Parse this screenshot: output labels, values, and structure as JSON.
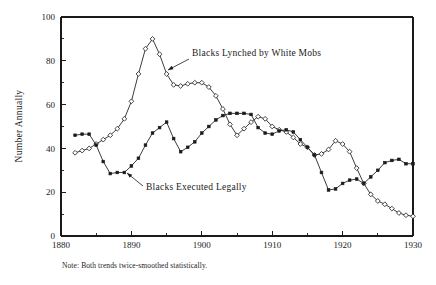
{
  "chart_data": {
    "type": "line",
    "title": "",
    "xlabel": "",
    "ylabel": "Number Annually",
    "xlim": [
      1880,
      1930
    ],
    "ylim": [
      0,
      100
    ],
    "grid": false,
    "legend_position": "inline-annotations",
    "x_ticks": [
      1880,
      1890,
      1900,
      1910,
      1920,
      1930
    ],
    "x_tick_labels": [
      "1880",
      "1890",
      "1900",
      "1910",
      "1920",
      "1930"
    ],
    "x_minor_ticks": [
      1885,
      1895,
      1905,
      1915,
      1925
    ],
    "y_ticks": [
      0,
      20,
      40,
      60,
      80,
      100
    ],
    "y_tick_labels": [
      "0",
      "20",
      "40",
      "60",
      "80",
      "100"
    ],
    "y_minor_ticks": [
      10,
      30,
      50,
      70,
      90
    ],
    "note": "Note: Both trends twice-smoothed statistically.",
    "series": [
      {
        "name": "Blacks Lynched by White Mobs",
        "marker": "open-diamond",
        "x": [
          1882,
          1883,
          1884,
          1885,
          1886,
          1887,
          1888,
          1889,
          1890,
          1891,
          1892,
          1893,
          1894,
          1895,
          1896,
          1897,
          1898,
          1899,
          1900,
          1901,
          1902,
          1903,
          1904,
          1905,
          1906,
          1907,
          1908,
          1909,
          1910,
          1911,
          1912,
          1913,
          1914,
          1915,
          1916,
          1917,
          1918,
          1919,
          1920,
          1921,
          1922,
          1923,
          1924,
          1925,
          1926,
          1927,
          1928,
          1929,
          1930
        ],
        "values": [
          38,
          39,
          40,
          42,
          44,
          46,
          49,
          53.5,
          61.5,
          74,
          85.5,
          90,
          83,
          74,
          69,
          68.5,
          69.5,
          70,
          70,
          68,
          64,
          58,
          51,
          46,
          49,
          52,
          54.5,
          53.5,
          50,
          48.5,
          47.5,
          45,
          42,
          40.5,
          37,
          37.5,
          39.5,
          43.5,
          42,
          38.5,
          31,
          24,
          19,
          16,
          14.5,
          12.5,
          10.5,
          9.5,
          9
        ]
      },
      {
        "name": "Blacks Executed Legally",
        "marker": "filled-square",
        "x": [
          1882,
          1883,
          1884,
          1885,
          1886,
          1887,
          1888,
          1889,
          1890,
          1891,
          1892,
          1893,
          1894,
          1895,
          1896,
          1897,
          1898,
          1899,
          1900,
          1901,
          1902,
          1903,
          1904,
          1905,
          1906,
          1907,
          1908,
          1909,
          1910,
          1911,
          1912,
          1913,
          1914,
          1915,
          1916,
          1917,
          1918,
          1919,
          1920,
          1921,
          1922,
          1923,
          1924,
          1925,
          1926,
          1927,
          1928,
          1929,
          1930
        ],
        "values": [
          46,
          46.5,
          46.5,
          41.5,
          34,
          28.5,
          29,
          29,
          32,
          35.5,
          41.5,
          47,
          49.5,
          52,
          44.5,
          38.5,
          40.5,
          43,
          47,
          50,
          53,
          55,
          56,
          56,
          56,
          55.5,
          49.5,
          47,
          46.5,
          48,
          48.5,
          47.5,
          44,
          40.5,
          37,
          29,
          21,
          21.5,
          24,
          25.5,
          26,
          24,
          27,
          30,
          33.5,
          34.5,
          35,
          33,
          33
        ]
      }
    ],
    "annotations": [
      {
        "name": "lynched-annotation",
        "text": "Blacks Lynched by White Mobs",
        "text_x": 192,
        "text_y": 56,
        "arrow_from_x": 189,
        "arrow_from_y": 59,
        "arrow_to_x": 168,
        "arrow_to_y": 70
      },
      {
        "name": "executed-annotation",
        "text": "Blacks Executed Legally",
        "text_x": 146,
        "text_y": 190,
        "arrow_from_x": 143,
        "arrow_from_y": 186,
        "arrow_to_x": 127,
        "arrow_to_y": 173
      }
    ]
  },
  "plot_geometry": {
    "left": 61,
    "right": 413,
    "top": 17,
    "bottom": 236
  }
}
